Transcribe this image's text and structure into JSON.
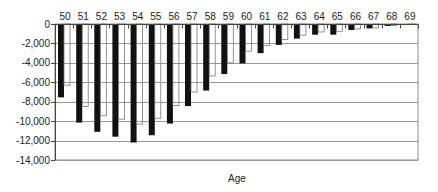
{
  "chart_data": {
    "type": "bar",
    "title": "",
    "xlabel": "Age",
    "ylabel": "",
    "ylim": [
      -14000,
      0
    ],
    "yticks": [
      0,
      -2000,
      -4000,
      -6000,
      -8000,
      -10000,
      -12000,
      -14000
    ],
    "ytick_labels": [
      "0",
      "-2,000",
      "-4,000",
      "-6,000",
      "-8,000",
      "-10,000",
      "-12,000",
      "-14,000"
    ],
    "grid": true,
    "legend": null,
    "categories": [
      "50",
      "51",
      "52",
      "53",
      "54",
      "55",
      "56",
      "57",
      "58",
      "59",
      "60",
      "61",
      "62",
      "63",
      "64",
      "65",
      "66",
      "67",
      "68",
      "69"
    ],
    "series": [
      {
        "name": "Series 1 (black)",
        "color": "#111111",
        "values": [
          -7550,
          -10150,
          -11100,
          -11600,
          -12200,
          -11450,
          -10250,
          -8450,
          -6850,
          -5150,
          -4050,
          -3000,
          -2150,
          -1500,
          -1100,
          -1100,
          -620,
          -450,
          -200,
          -60
        ]
      },
      {
        "name": "Series 2 (white)",
        "color": "#ffffff",
        "values": [
          -6300,
          -8500,
          -9450,
          -9800,
          -10300,
          -9700,
          -8400,
          -7000,
          -5350,
          -4000,
          -2800,
          -2200,
          -1600,
          -1150,
          -820,
          -750,
          -500,
          -400,
          -150,
          -40
        ]
      }
    ]
  }
}
